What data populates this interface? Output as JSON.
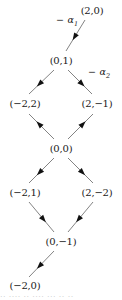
{
  "figure": {
    "type": "weight-lattice-hasse-diagram",
    "background_color": "#ffffff",
    "ink_color": "#1a1a1a",
    "edge_color": "#4d4d4d",
    "width": 122,
    "height": 300
  },
  "nodes": [
    {
      "id": "n1",
      "label": "(2,0)",
      "x": 92,
      "y": 10
    },
    {
      "id": "n2",
      "label": "(0,1)",
      "x": 61,
      "y": 60
    },
    {
      "id": "n3",
      "label": "(−2,2)",
      "x": 25,
      "y": 103
    },
    {
      "id": "n4",
      "label": "(2,−1)",
      "x": 97,
      "y": 103
    },
    {
      "id": "n5",
      "label": "(0,0)",
      "x": 61,
      "y": 148
    },
    {
      "id": "n6",
      "label": "(−2,1)",
      "x": 25,
      "y": 192
    },
    {
      "id": "n7",
      "label": "(2,−2)",
      "x": 97,
      "y": 192
    },
    {
      "id": "n8",
      "label": "(0,−1)",
      "x": 61,
      "y": 241
    },
    {
      "id": "n9",
      "label": "(−2,0)",
      "x": 25,
      "y": 285
    }
  ],
  "edges": [
    {
      "id": "e1",
      "from": "n1",
      "to": "n2",
      "x1": 85,
      "y1": 20,
      "x2": 66,
      "y2": 51,
      "arrow_at": 0.55
    },
    {
      "id": "e2",
      "from": "n2",
      "to": "n3",
      "x1": 54,
      "y1": 70,
      "x2": 29,
      "y2": 94,
      "arrow_at": 0.58
    },
    {
      "id": "e3",
      "from": "n2",
      "to": "n4",
      "x1": 68,
      "y1": 70,
      "x2": 92,
      "y2": 94,
      "arrow_at": 0.58
    },
    {
      "id": "e4",
      "from": "n5",
      "to": "n3",
      "x1": 54,
      "y1": 139,
      "x2": 29,
      "y2": 114,
      "arrow_at": 0.6
    },
    {
      "id": "e5",
      "from": "n5",
      "to": "n4",
      "x1": 68,
      "y1": 139,
      "x2": 93,
      "y2": 114,
      "arrow_at": 0.6
    },
    {
      "id": "e6",
      "from": "n5",
      "to": "n6",
      "x1": 54,
      "y1": 158,
      "x2": 29,
      "y2": 183,
      "arrow_at": 0.58
    },
    {
      "id": "e7",
      "from": "n5",
      "to": "n7",
      "x1": 68,
      "y1": 158,
      "x2": 93,
      "y2": 183,
      "arrow_at": 0.58
    },
    {
      "id": "e8",
      "from": "n6",
      "to": "n8",
      "x1": 29,
      "y1": 202,
      "x2": 54,
      "y2": 232,
      "arrow_at": 0.58
    },
    {
      "id": "e9",
      "from": "n7",
      "to": "n8",
      "x1": 93,
      "y1": 202,
      "x2": 68,
      "y2": 232,
      "arrow_at": 0.58
    },
    {
      "id": "e10",
      "from": "n8",
      "to": "n9",
      "x1": 54,
      "y1": 251,
      "x2": 29,
      "y2": 277,
      "arrow_at": 0.58
    }
  ],
  "edge_labels": [
    {
      "id": "alpha1",
      "minus": "−",
      "greek": "α",
      "subscript": "1",
      "full_text": "−α₁",
      "for_edge": "e1",
      "x": 67,
      "y": 22
    },
    {
      "id": "alpha2",
      "minus": "−",
      "greek": "α",
      "subscript": "2",
      "full_text": "−α₂",
      "for_edge": "e3",
      "x": 99,
      "y": 74
    }
  ],
  "footer": {
    "clipped_text": "··  ····   ·· ····  ···  ·· ··"
  }
}
